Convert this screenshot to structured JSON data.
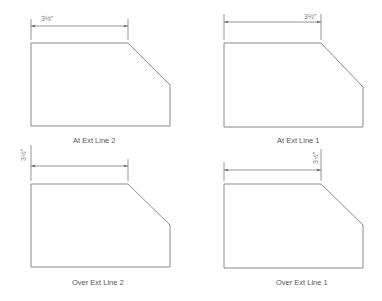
{
  "colors": {
    "background": "#ffffff",
    "outline": "#8a8a8a",
    "dimension": "#7a7a7a",
    "caption": "#555555"
  },
  "panels": [
    {
      "id": "top-left",
      "caption": "At Ext Line 2",
      "dimension_text": "3½\"",
      "text_placement": "at extension line 2 (left), horizontal"
    },
    {
      "id": "top-right",
      "caption": "At Ext Line 1",
      "dimension_text": "3½\"",
      "text_placement": "at extension line 1 (right), horizontal"
    },
    {
      "id": "bottom-left",
      "caption": "Over Ext Line 2",
      "dimension_text": "3½\"",
      "text_placement": "over extension line 2 (left), rotated"
    },
    {
      "id": "bottom-right",
      "caption": "Over Ext Line 1",
      "dimension_text": "3½\"",
      "text_placement": "over extension line 1 (right), rotated"
    }
  ]
}
